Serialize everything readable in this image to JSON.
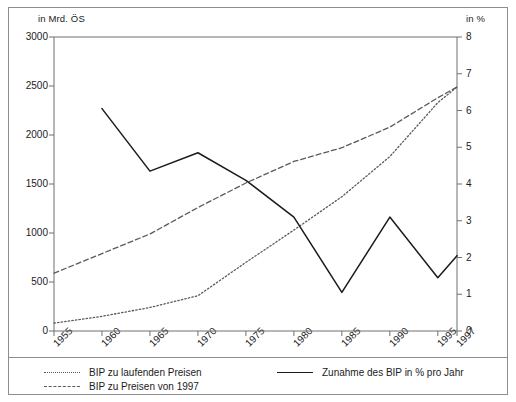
{
  "axes": {
    "left_unit": "in Mrd. ÖS",
    "right_unit": "in %",
    "left_ticks": [
      "3000",
      "2500",
      "2000",
      "1500",
      "1000",
      "500",
      "0"
    ],
    "right_ticks": [
      "8",
      "7",
      "6",
      "5",
      "4",
      "3",
      "2",
      "1",
      "0"
    ],
    "x_ticks": [
      "1955",
      "1960",
      "1965",
      "1970",
      "1975",
      "1980",
      "1985",
      "1990",
      "1995",
      "1997"
    ]
  },
  "legend": {
    "items": [
      {
        "label": "BIP zu laufenden Preisen",
        "style": "dotted",
        "color": "#5a5a5a"
      },
      {
        "label": "BIP zu Preisen von 1997",
        "style": "dashed",
        "color": "#5a5a5a"
      },
      {
        "label": "Zunahme des BIP in % pro Jahr",
        "style": "solid",
        "color": "#1b1b1b"
      }
    ]
  },
  "chart_data": {
    "type": "line",
    "title": "",
    "xlabel": "",
    "ylabel": "in Mrd. ÖS",
    "y2label": "in %",
    "xlim": [
      1955,
      1997
    ],
    "ylim": [
      0,
      3000
    ],
    "y2lim": [
      0,
      8
    ],
    "grid": false,
    "legend_position": "bottom",
    "x": [
      1955,
      1960,
      1965,
      1970,
      1975,
      1980,
      1985,
      1990,
      1995,
      1997
    ],
    "series": [
      {
        "name": "BIP zu laufenden Preisen",
        "axis": "left",
        "style": "dotted",
        "color": "#5a5a5a",
        "x": [
          1955,
          1960,
          1965,
          1970,
          1975,
          1980,
          1985,
          1990,
          1995,
          1997
        ],
        "values": [
          80,
          150,
          240,
          360,
          700,
          1030,
          1370,
          1780,
          2330,
          2490
        ]
      },
      {
        "name": "BIP zu Preisen von 1997",
        "axis": "left",
        "style": "dashed",
        "color": "#5a5a5a",
        "x": [
          1955,
          1960,
          1965,
          1970,
          1975,
          1980,
          1985,
          1990,
          1995,
          1997
        ],
        "values": [
          590,
          790,
          990,
          1260,
          1510,
          1730,
          1870,
          2080,
          2380,
          2490
        ]
      },
      {
        "name": "Zunahme des BIP in % pro Jahr",
        "axis": "right",
        "style": "solid",
        "color": "#1b1b1b",
        "x": [
          1960,
          1965,
          1970,
          1975,
          1980,
          1985,
          1990,
          1995,
          1997
        ],
        "values": [
          6.05,
          4.35,
          4.85,
          4.1,
          3.1,
          1.05,
          3.1,
          1.45,
          2.05
        ]
      }
    ]
  },
  "colors": {
    "frame": "#8d8d8d",
    "axis": "#6f6f6f",
    "text": "#1b1b1b",
    "solid_line": "#1b1b1b",
    "muted_line": "#5a5a5a"
  }
}
